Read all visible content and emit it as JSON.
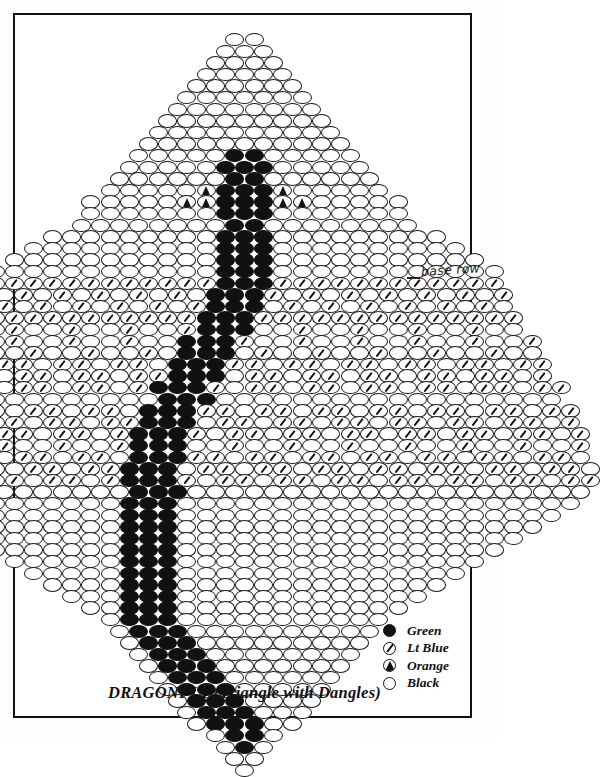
{
  "title": "DRAGONFLY (Triangle with Dangles)",
  "annotation": {
    "base_row_label": "base row"
  },
  "legend": {
    "items": [
      {
        "icon": "filled-circle-bead-icon",
        "symbol": "green",
        "label": "Green"
      },
      {
        "icon": "slashed-circle-bead-icon",
        "symbol": "blue",
        "label": "Lt Blue"
      },
      {
        "icon": "triangle-circle-bead-icon",
        "symbol": "orange",
        "label": "Orange"
      },
      {
        "icon": "empty-circle-bead-icon",
        "symbol": "black",
        "label": "Black"
      }
    ]
  },
  "colors": {
    "green": "#111111",
    "black_outline": "#1a1a1a",
    "paper": "#ffffff",
    "frame": "#111111"
  },
  "bead_grid": {
    "bead_width": 19.2,
    "bead_height": 13.4,
    "row_pitch": 11.6,
    "col_pitch": 19.2,
    "origin_x": 229.5,
    "origin_y": 18,
    "legend_key": {
      "k": "black",
      "g": "green",
      "b": "blue",
      "o": "orange",
      ".": "empty"
    },
    "description": "Brick-stitch triangle-with-dangles. Each row string is read left to right; rows alternate half-bead horizontal offset. Row strings are centered on origin_x.",
    "rows": [
      "kk",
      "kkk",
      "kkkk",
      "kkkkk",
      "kkkkkk",
      "kkkkkkk",
      "kkkkkkkk",
      "kkkkkkkkk",
      "kkkkkkkkkk",
      "kkkkkkkkkkk",
      "kkkkkggkkkkk",
      "kkkkkgggkkkkk",
      "kkkkkkggkkkkkk",
      "kkkkkogggokkkkk",
      "kkkkkoogggookkkkk",
      "kkkkkkkgggkkkkkkk",
      "kkkkkkkkggkkkkkkkk",
      "kkkkkkkkkgggkkkkkkkkk",
      "kkkkkkkkkkgggkkkkkkkkkk",
      "kkkkkkkkkkkgggkkkkkkkkkkk",
      "kkkkkkkkkkkkgggkkkkkkkkkkkk",
      "bbbbbbbbbbbbgggbbbbbbbbbbbb",
      "bkbkbkbkbkbkgggbkbkbkbkbkbkb",
      "kbkbkbkbkbkbgggkbkbkbkbkbkbk",
      "bbbbbbbbbbbbgggbbbbbbbbbbbbbb",
      "kkbkkbkkbkkbgggkkbkkbkkbkkbkk",
      "bkkbkkbkkbkkgggbkkbkkbkkbkkbkkb",
      "kbkkbkkbkkbkgggkbkkbkkbkkbkkbkk",
      "bbkbbkbbkbbkgggbbkbbkbbkbbkbbkbb",
      "kbbkbbkbbkbbgggkbbkbbkbbkbbkbbkb",
      "bkbbkbbkbbkbgggbkbbkbbkbbkbbkbbkbb",
      "kkkkkkkkkkkkgggkkkkkkkkkkkkkkkkkk",
      "bbkbbkbbkbbkgggbbkbbkbbkbbkbbkbbkbb",
      "kbbkbbkbbkbbgggkbbkbbkbbkbbkbbkbbkb",
      "bkbbkbbkbbkbgggbkbbkbbkbbkbbkbbkbbkb",
      "kkbkkbkkbkkbgggkkbkkbkkbkkbkkbkkbkkb",
      "bbkbbkbbkbbkgggbbkbbkbbkbbkbbkbbkbbk",
      "kbbkbbkbbkbbgggkbbkbbkbbkbbkbbkbbkbbk",
      "bkbbkbbkbbkbgggbkbbkbbkbbkbbkbbkbbkbb",
      "kkkkkkkkkkkkgggkkkkkkkkkkkkkkkkkkkkk",
      "kkkkkkkkkkkgggkkkkkkkkkkkkkkkkkkkkk",
      "kkkkkkkkkkgggkkkkkkkkkkkkkkkkkkkk",
      "kkkkkkkkkgggkkkkkkkkkkkkkkkkkkk",
      "kkkkkkkkgggkkkkkkkkkkkkkkkkkk",
      "kkkkkkkgggkkkkkkkkkkkkkkkkk",
      "kkkkkkgggkkkkkkkkkkkkkkkk",
      "kkkkkgggkkkkkkkkkkkkkkk",
      "kkkkgggkkkkkkkkkkkkkk",
      "kkkgggkkkkkkkkkkkkk",
      "kkgggkkkkkkkkkkkk",
      "kgggkkkkkkkkkkk",
      "kgggkkkkkkkkkk",
      "kgggkkkkkkkkk",
      "kgggkkkkkkkk",
      "kgggkkkkkkk",
      "kgggkkkkkk",
      "kgggkkkkk",
      "kgggkkkk",
      "kgggkkk",
      "kgggkk",
      "kggk",
      "kgk",
      "kk",
      "k"
    ]
  }
}
